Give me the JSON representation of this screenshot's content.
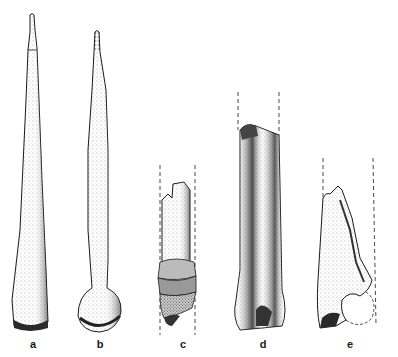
{
  "figure": {
    "background": "#ffffff",
    "ink_color": "#1a1a1a",
    "specimens": [
      {
        "id": "a",
        "label": "a",
        "description": "long tapered bone awl with blunt flared base"
      },
      {
        "id": "b",
        "label": "b",
        "description": "long tapered bone awl with rounded knob (articular head) base"
      },
      {
        "id": "c",
        "label": "c",
        "description": "broken shaft fragment with wrapped band near base, dashed reconstruction lines"
      },
      {
        "id": "d",
        "label": "d",
        "description": "split long bone shaft with grooved face, dashed reconstruction lines"
      },
      {
        "id": "e",
        "label": "e",
        "description": "pointed bone fragment with notch at base, dashed reconstruction outline"
      }
    ]
  }
}
